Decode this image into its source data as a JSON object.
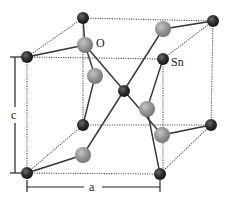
{
  "figure": {
    "labels": {
      "oxygen": "O",
      "tin": "Sn",
      "lattice_a": "a",
      "lattice_c": "c"
    },
    "colors": {
      "sn": "#2b2b2b",
      "sn_highlight": "#6a6a6a",
      "o": "#8c8c8c",
      "o_highlight": "#c4c4c4",
      "bond": "#333333",
      "cell_edge": "#555555",
      "dimension": "#222222"
    },
    "sn_atoms": [
      {
        "name": "sn-back-top-left",
        "x": 83,
        "y": 18
      },
      {
        "name": "sn-back-top-right",
        "x": 213,
        "y": 21
      },
      {
        "name": "sn-front-top-left",
        "x": 27,
        "y": 57
      },
      {
        "name": "sn-front-top-right",
        "x": 163,
        "y": 59
      },
      {
        "name": "sn-center",
        "x": 124,
        "y": 91
      },
      {
        "name": "sn-back-bottom-left",
        "x": 83,
        "y": 125
      },
      {
        "name": "sn-back-bottom-right",
        "x": 211,
        "y": 125
      },
      {
        "name": "sn-front-bottom-left",
        "x": 27,
        "y": 173
      },
      {
        "name": "sn-front-bottom-right",
        "x": 160,
        "y": 174
      }
    ],
    "o_atoms": [
      {
        "name": "o-top",
        "x": 85,
        "y": 45
      },
      {
        "name": "o-upper-left",
        "x": 95,
        "y": 76
      },
      {
        "name": "o-top-right",
        "x": 163,
        "y": 29
      },
      {
        "name": "o-mid-right",
        "x": 147,
        "y": 109
      },
      {
        "name": "o-lower-right",
        "x": 162,
        "y": 135
      },
      {
        "name": "o-bottom-left",
        "x": 83,
        "y": 155
      }
    ]
  }
}
